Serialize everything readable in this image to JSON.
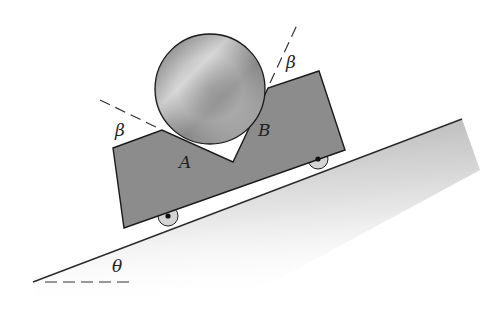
{
  "diagram": {
    "labels": {
      "contact_a": "A",
      "contact_b": "B",
      "angle_left": "β",
      "angle_right": "β",
      "incline_angle": "θ"
    },
    "colors": {
      "cart_fill": "#8c8c8c",
      "outline": "#1a1a1a",
      "incline_shade": "#bdbdbd",
      "cylinder_light": "#e0e0e0",
      "cylinder_dark": "#6e6e6e"
    }
  }
}
